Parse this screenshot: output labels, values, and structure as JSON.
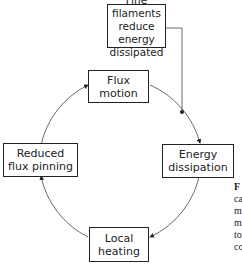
{
  "diagram": {
    "nodes": {
      "fine_filaments": "Fine filaments\nreduce energy\ndissipated",
      "flux_motion": "Flux\nmotion",
      "energy_dissipation": "Energy\ndissipation",
      "local_heating": "Local\nheating",
      "reduced_flux_pinning": "Reduced\nflux pinning"
    },
    "cycle_order": [
      "Flux motion",
      "Energy dissipation",
      "Local heating",
      "Reduced flux pinning"
    ],
    "external_influence": {
      "from": "Fine filaments reduce energy dissipated",
      "to": "cycle between Flux motion and Energy dissipation"
    },
    "line_color": "#222222"
  },
  "caption": {
    "label": "F",
    "lines": [
      "ca",
      "m",
      "m",
      "to",
      "co"
    ]
  }
}
